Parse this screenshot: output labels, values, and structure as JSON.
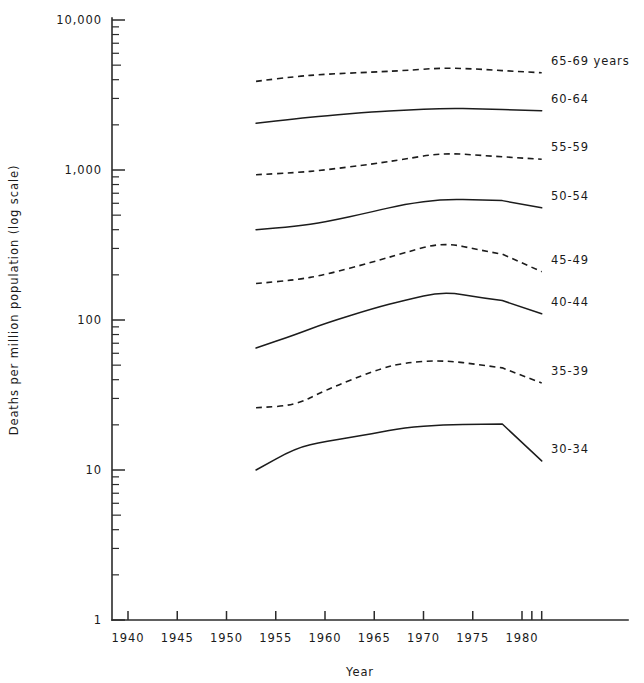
{
  "chart_data": {
    "type": "line",
    "title": "",
    "xlabel": "Year",
    "ylabel": "Deaths per million population (log scale)",
    "yscale": "log",
    "ylim": [
      1,
      10000
    ],
    "xlim": [
      1937,
      1984
    ],
    "grid": false,
    "legend_position": "right-inline",
    "y_tick_labels": [
      "10,000",
      "1,000",
      "100",
      "10",
      "1"
    ],
    "y_tick_values": [
      10000,
      1000,
      100,
      10,
      1
    ],
    "x_tick_labels": [
      "1940",
      "1945",
      "1950",
      "1955",
      "1960",
      "1965",
      "1970",
      "1975",
      "1980"
    ],
    "x_tick_values": [
      1940,
      1945,
      1950,
      1955,
      1960,
      1965,
      1970,
      1975,
      1980
    ],
    "x_extra_ticks": [
      1981,
      1982
    ],
    "series": [
      {
        "name": "65-69 years",
        "label": "65-69 years",
        "style": "dashed",
        "x": [
          1953,
          1957,
          1960,
          1965,
          1968,
          1972,
          1976,
          1980,
          1982
        ],
        "values": [
          3900,
          4200,
          4350,
          4500,
          4600,
          4800,
          4700,
          4500,
          4450
        ]
      },
      {
        "name": "60-64",
        "label": "60-64",
        "style": "solid",
        "x": [
          1953,
          1957,
          1960,
          1965,
          1968,
          1972,
          1976,
          1980,
          1982
        ],
        "values": [
          2050,
          2200,
          2300,
          2450,
          2500,
          2580,
          2560,
          2500,
          2480
        ]
      },
      {
        "name": "55-59",
        "label": "55-59",
        "style": "dashed",
        "x": [
          1953,
          1957,
          1960,
          1965,
          1968,
          1972,
          1976,
          1980,
          1982
        ],
        "values": [
          930,
          960,
          1000,
          1100,
          1180,
          1300,
          1250,
          1200,
          1180
        ]
      },
      {
        "name": "50-54",
        "label": "50-54",
        "style": "solid",
        "x": [
          1953,
          1957,
          1960,
          1965,
          1968,
          1972,
          1976,
          1980,
          1982
        ],
        "values": [
          400,
          420,
          450,
          530,
          590,
          640,
          630,
          620,
          560
        ]
      },
      {
        "name": "45-49",
        "label": "45-49",
        "style": "dashed",
        "x": [
          1953,
          1957,
          1960,
          1965,
          1968,
          1972,
          1976,
          1980,
          1982
        ],
        "values": [
          175,
          185,
          200,
          245,
          280,
          330,
          290,
          260,
          210
        ]
      },
      {
        "name": "40-44",
        "label": "40-44",
        "style": "solid",
        "x": [
          1953,
          1957,
          1960,
          1965,
          1968,
          1972,
          1976,
          1980,
          1982
        ],
        "values": [
          65,
          80,
          95,
          120,
          135,
          155,
          140,
          130,
          110
        ]
      },
      {
        "name": "35-39",
        "label": "35-39",
        "style": "dashed",
        "x": [
          1953,
          1957,
          1960,
          1965,
          1968,
          1972,
          1976,
          1980,
          1982
        ],
        "values": [
          26,
          27,
          34,
          46,
          52,
          54,
          50,
          46,
          38
        ]
      },
      {
        "name": "30-34",
        "label": "30-34",
        "style": "solid",
        "x": [
          1953,
          1957,
          1960,
          1965,
          1968,
          1972,
          1976,
          1980,
          1982
        ],
        "values": [
          10,
          14,
          15.5,
          17.5,
          19.2,
          20,
          20.2,
          20.3,
          11.5
        ]
      }
    ]
  }
}
